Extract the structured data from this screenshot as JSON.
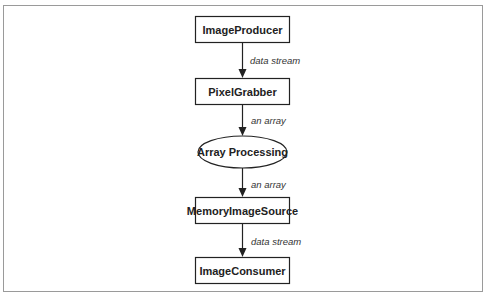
{
  "diagram": {
    "nodes": [
      {
        "id": "image-producer",
        "label": "ImageProducer",
        "shape": "rect"
      },
      {
        "id": "pixel-grabber",
        "label": "PixelGrabber",
        "shape": "rect"
      },
      {
        "id": "array-processing",
        "label": "Array Processing",
        "shape": "ellipse"
      },
      {
        "id": "memory-image-source",
        "label": "MemoryImageSource",
        "shape": "rect"
      },
      {
        "id": "image-consumer",
        "label": "ImageConsumer",
        "shape": "rect"
      }
    ],
    "edges": [
      {
        "from": "image-producer",
        "to": "pixel-grabber",
        "label": "data stream"
      },
      {
        "from": "pixel-grabber",
        "to": "array-processing",
        "label": "an array"
      },
      {
        "from": "array-processing",
        "to": "memory-image-source",
        "label": "an array"
      },
      {
        "from": "memory-image-source",
        "to": "image-consumer",
        "label": "data stream"
      }
    ],
    "colors": {
      "stroke": "#222222",
      "frame": "#9a9a9a",
      "background": "#ffffff"
    }
  }
}
